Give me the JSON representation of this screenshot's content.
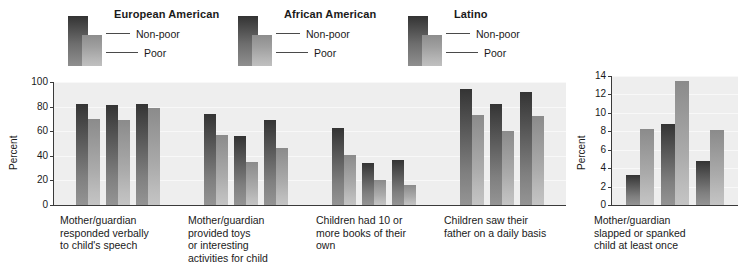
{
  "legend": {
    "groups": [
      {
        "title": "European American",
        "rows": [
          {
            "label": "Non-poor"
          },
          {
            "label": "Poor"
          }
        ]
      },
      {
        "title": "African American",
        "rows": [
          {
            "label": "Non-poor"
          },
          {
            "label": "Poor"
          }
        ]
      },
      {
        "title": "Latino",
        "rows": [
          {
            "label": "Non-poor"
          },
          {
            "label": "Poor"
          }
        ]
      }
    ]
  },
  "chart_data": [
    {
      "type": "bar",
      "title": "",
      "xlabel": "",
      "ylabel": "Percent",
      "ylim": [
        0,
        100
      ],
      "yticks": [
        "0",
        "20",
        "40",
        "60",
        "80",
        "100"
      ],
      "grid": true,
      "legend_position": "top",
      "categories": [
        "Mother/guardian\nresponded verbally\nto child's speech",
        "Mother/guardian\nprovided toys\nor interesting\nactivities for child",
        "Children had 10 or\nmore books of their\nown",
        "Children saw their\nfather on a daily basis"
      ],
      "series": [
        {
          "name": "European American Non-poor",
          "values": [
            82,
            74,
            63,
            94
          ]
        },
        {
          "name": "European American Poor",
          "values": [
            70,
            57,
            41,
            73
          ]
        },
        {
          "name": "African American Non-poor",
          "values": [
            81,
            56,
            34,
            82
          ]
        },
        {
          "name": "African American Poor",
          "values": [
            69,
            35,
            20,
            60
          ]
        },
        {
          "name": "Latino Non-poor",
          "values": [
            82,
            69,
            37,
            92
          ]
        },
        {
          "name": "Latino Poor",
          "values": [
            79,
            46,
            16,
            72
          ]
        }
      ]
    },
    {
      "type": "bar",
      "title": "",
      "xlabel": "",
      "ylabel": "Percent",
      "ylim": [
        0,
        14
      ],
      "yticks": [
        "0",
        "2",
        "4",
        "6",
        "8",
        "10",
        "12",
        "14"
      ],
      "grid": true,
      "legend_position": "top",
      "categories": [
        "Mother/guardian\nslapped or spanked\nchild at least once"
      ],
      "series": [
        {
          "name": "European American Non-poor",
          "values": [
            3.3
          ]
        },
        {
          "name": "European American Poor",
          "values": [
            8.3
          ]
        },
        {
          "name": "African American Non-poor",
          "values": [
            8.8
          ]
        },
        {
          "name": "African American Poor",
          "values": [
            13.5
          ]
        },
        {
          "name": "Latino Non-poor",
          "values": [
            4.8
          ]
        },
        {
          "name": "Latino Poor",
          "values": [
            8.1
          ]
        }
      ]
    }
  ]
}
